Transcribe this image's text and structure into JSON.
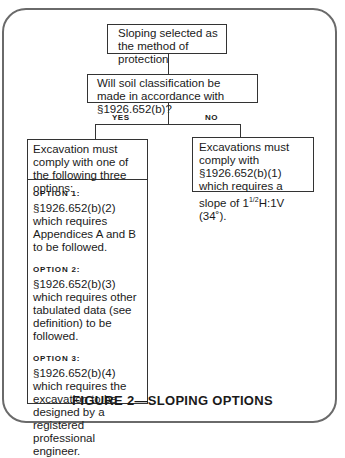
{
  "flowchart": {
    "start": "Sloping selected as the method of protection",
    "question": "Will soil classification be made in accordance with §1926.652(b)?",
    "yes_label": "YES",
    "no_label": "NO",
    "yes_box": {
      "header": "Excavation must comply with one of the following three options:",
      "options": [
        {
          "title": "OPTION 1:",
          "text": "§1926.652(b)(2) which requires Appendices A and B to be followed."
        },
        {
          "title": "OPTION 2:",
          "text": "§1926.652(b)(3) which requires other tabulated data (see definition) to be followed."
        },
        {
          "title": "OPTION 3:",
          "text": "§1926.652(b)(4) which requires the excavation to be designed by a registered professional engineer."
        }
      ]
    },
    "no_box": {
      "text_line1": "Excavations must comply with §1926.652(b)(1) which requires a slope of",
      "slope_whole": "1",
      "slope_frac": "1/2",
      "slope_rest": "H:1V (34˚)."
    }
  },
  "caption": "FIGURE 2—SLOPING OPTIONS"
}
